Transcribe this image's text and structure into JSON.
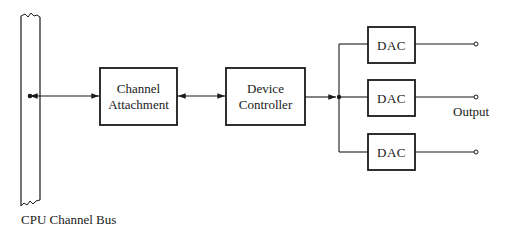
{
  "diagram": {
    "bus": {
      "label": "CPU Channel Bus"
    },
    "blocks": {
      "channel_attachment": {
        "line1": "Channel",
        "line2": "Attachment"
      },
      "device_controller": {
        "line1": "Device",
        "line2": "Controller"
      }
    },
    "dacs": [
      {
        "label": "DAC"
      },
      {
        "label": "DAC"
      },
      {
        "label": "DAC"
      }
    ],
    "output_label": "Output",
    "colors": {
      "stroke": "#1a1a1a",
      "background": "#ffffff"
    }
  }
}
